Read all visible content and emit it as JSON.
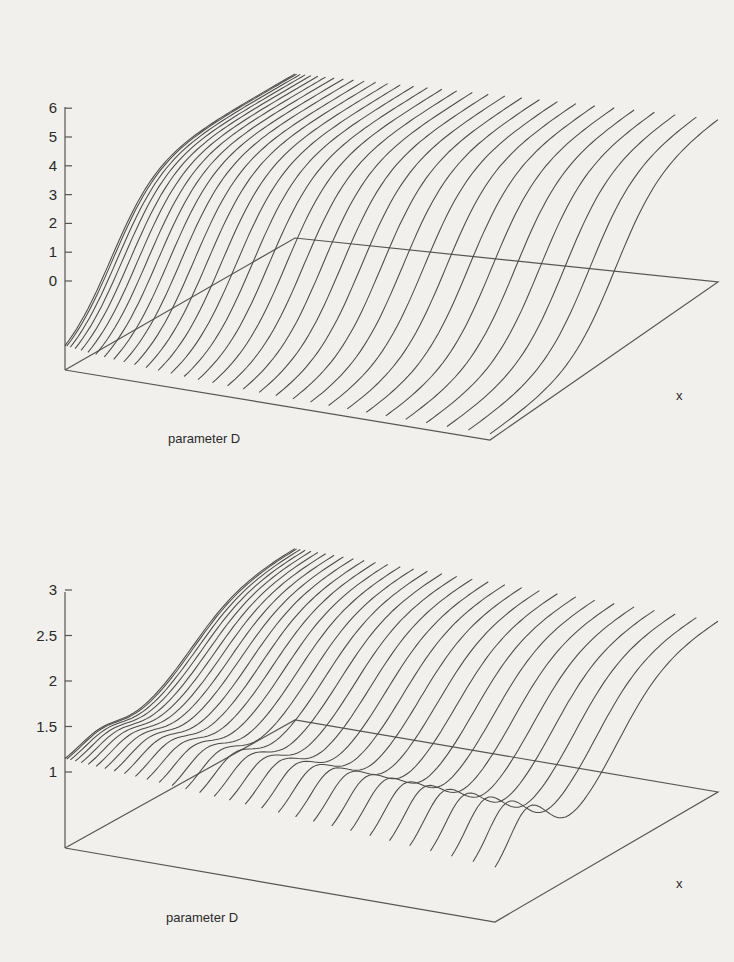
{
  "chart_data": [
    {
      "type": "line",
      "subtype": "3d-surface-lines",
      "title": "",
      "xlabel": "x",
      "ylabel": "parameter D",
      "zlabel": "",
      "z_ticks": [
        "0",
        "1",
        "2",
        "3",
        "4",
        "5",
        "6"
      ],
      "zlim": [
        0,
        6
      ],
      "n_curves": 32,
      "description": "Family of sigmoid-like curves rising from about 0 at the front edge to about 6 at the back ridge; curves converge into a dense twisted band near small D",
      "series_shape": {
        "min": 0.2,
        "max": 6.0
      }
    },
    {
      "type": "line",
      "subtype": "3d-surface-lines",
      "title": "",
      "xlabel": "x",
      "ylabel": "parameter D",
      "zlabel": "",
      "z_ticks": [
        "1",
        "1.5",
        "2",
        "2.5",
        "3"
      ],
      "zlim": [
        1,
        3
      ],
      "n_curves": 32,
      "description": "Family of curves starting near 2 at left, rising through a hump toward about 3 at the back ridge, with oscillating bumps (about 2.4) decaying toward 1.5 near the front edge",
      "series_shape": {
        "min": 1.5,
        "max": 3.0
      }
    }
  ]
}
